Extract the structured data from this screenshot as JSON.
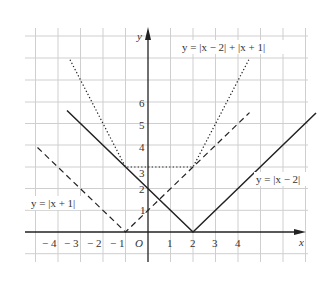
{
  "figure": {
    "background": "#ffffff",
    "grid_color": "#cfcfcf",
    "ink_color": "#222222",
    "axes": {
      "x_label": "x",
      "y_label": "y",
      "origin_label": "O",
      "x_ticks": [
        "− 4",
        "− 3",
        "− 2",
        "− 1",
        "1",
        "2",
        "3",
        "4"
      ],
      "y_ticks": [
        "1",
        "2",
        "3",
        "4",
        "5",
        "6"
      ]
    },
    "curves": [
      {
        "name": "y=|x-2|",
        "style": "solid",
        "label": "y = |x − 2|",
        "points": [
          [
            -3.6,
            5.6
          ],
          [
            2,
            0
          ],
          [
            7.45,
            5.45
          ]
        ]
      },
      {
        "name": "y=|x+1|",
        "style": "dashed",
        "label": "y = |x + 1|",
        "points": [
          [
            -4.9,
            3.9
          ],
          [
            -1,
            0
          ],
          [
            4.5,
            5.5
          ]
        ]
      },
      {
        "name": "y=|x-2|+|x+1|",
        "style": "dotted",
        "label": "y = |x − 2| + |x + 1|",
        "points": [
          [
            -3.47,
            7.94
          ],
          [
            -1,
            3
          ],
          [
            2,
            3
          ],
          [
            4.5,
            8.0
          ]
        ]
      }
    ],
    "labels": {
      "eq_sum": "y = |x − 2| + |x + 1|",
      "eq_shift_right": "y = |x − 2|",
      "eq_shift_left": "y = |x + 1|"
    }
  }
}
